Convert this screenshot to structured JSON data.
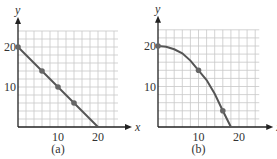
{
  "chart_data": [
    {
      "type": "line",
      "panel_label": "(a)",
      "xlabel": "x",
      "ylabel": "y",
      "x_ticks": [
        "10",
        "20"
      ],
      "y_ticks": [
        "10",
        "20"
      ],
      "xlim": [
        0,
        25
      ],
      "ylim": [
        0,
        24
      ],
      "grid": true,
      "grid_step": 2,
      "series": [
        {
          "name": "line",
          "x": [
            0,
            20
          ],
          "y": [
            20,
            0
          ],
          "markers": [
            {
              "x": 0,
              "y": 20
            },
            {
              "x": 6,
              "y": 14
            },
            {
              "x": 10,
              "y": 10
            },
            {
              "x": 14,
              "y": 6
            }
          ]
        }
      ]
    },
    {
      "type": "line",
      "panel_label": "(b)",
      "xlabel": "x",
      "ylabel": "y",
      "x_ticks": [
        "10",
        "20"
      ],
      "y_ticks": [
        "10",
        "20"
      ],
      "xlim": [
        0,
        25
      ],
      "ylim": [
        0,
        24
      ],
      "grid": true,
      "grid_step": 2,
      "series": [
        {
          "name": "curve",
          "x": [
            0,
            2,
            4,
            6,
            8,
            10,
            12,
            14,
            16,
            18
          ],
          "y": [
            20,
            19.8,
            19.2,
            18.2,
            16.4,
            14,
            11.6,
            8.2,
            4,
            0
          ],
          "markers": [
            {
              "x": 0,
              "y": 20
            },
            {
              "x": 10,
              "y": 14
            },
            {
              "x": 16,
              "y": 4
            }
          ]
        }
      ]
    }
  ],
  "colors": {
    "grid": "#c8c8c8",
    "axis": "#222222",
    "line": "#555555",
    "marker": "#666666"
  }
}
